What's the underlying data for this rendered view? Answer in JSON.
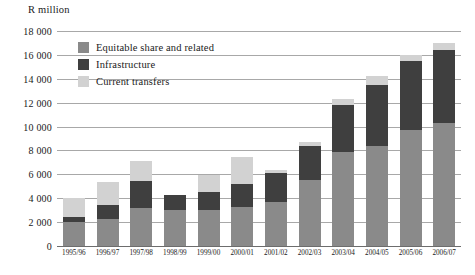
{
  "chart_data": {
    "type": "bar",
    "stacked": true,
    "title": "",
    "subtitle": "",
    "xlabel": "",
    "ylabel": "R million",
    "ylim": [
      0,
      18000
    ],
    "ytick_step": 2000,
    "grid": true,
    "legend_position": "inside-top-left",
    "categories": [
      "1995/96",
      "1996/97",
      "1997/98",
      "1998/99",
      "1999/00",
      "2000/01",
      "2001/02",
      "2002/03",
      "2003/04",
      "2004/05",
      "2005/06",
      "2006/07"
    ],
    "ytick_labels": [
      "0",
      "2 000",
      "4 000",
      "6 000",
      "8 000",
      "10 000",
      "12 000",
      "14 000",
      "16 000",
      "18 000"
    ],
    "ytick_values": [
      0,
      2000,
      4000,
      6000,
      8000,
      10000,
      12000,
      14000,
      16000,
      18000
    ],
    "series": [
      {
        "name": "Equitable share and related",
        "color": "#8a8a8a",
        "values": [
          2000,
          2250,
          3200,
          3000,
          3000,
          3250,
          3700,
          5500,
          7900,
          8400,
          9700,
          10300
        ]
      },
      {
        "name": "Infrastructure",
        "color": "#3f3f3f",
        "values": [
          400,
          1150,
          2250,
          1300,
          1550,
          1950,
          2400,
          2900,
          3900,
          5100,
          5800,
          6100
        ]
      },
      {
        "name": "Current transfers",
        "color": "#d2d2d2",
        "values": [
          1600,
          1950,
          1650,
          0,
          1400,
          2250,
          250,
          300,
          500,
          750,
          500,
          600
        ]
      }
    ],
    "totals": [
      4000,
      5350,
      7100,
      4300,
      5950,
      7450,
      6350,
      8700,
      12300,
      14250,
      16000,
      17000
    ]
  },
  "legend": {
    "items": [
      {
        "label": "Equitable share and related",
        "color": "#8a8a8a"
      },
      {
        "label": "Infrastructure",
        "color": "#3f3f3f"
      },
      {
        "label": "Current transfers",
        "color": "#d2d2d2"
      }
    ]
  }
}
